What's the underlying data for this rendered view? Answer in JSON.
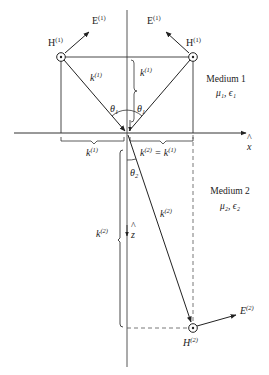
{
  "figure": {
    "type": "wave refraction diagram at planar interface",
    "labels": {
      "H1_left": "H",
      "H1_left_sup": "(1)",
      "H1_left_sub": "+",
      "E1_left": "E",
      "E1_left_sup": "(1)",
      "E1_left_sub": "+",
      "H1_right": "H",
      "H1_right_sup": "(1)",
      "H1_right_sub": "−",
      "E1_right": "E",
      "E1_right_sup": "(1)",
      "E1_right_sub": "−",
      "k1": "k",
      "k1_sup": "(1)",
      "kz1": "k",
      "kz1_sub": "z",
      "kz1_sup": "(1)",
      "theta1_left": "θ",
      "theta1_left_sub": "1",
      "theta1_right": "θ",
      "theta1_right_sub": "1",
      "kx1": "k",
      "kx1_sub": "x",
      "kx1_sup": "(1)",
      "kx_eq": "k",
      "kx_eq_sub": "x",
      "kx_eq_sup": "(2)",
      "kx_eq_mid": " = k",
      "kx_eq_sub2": "x",
      "kx_eq_sup2": "(1)",
      "x_axis": "x",
      "x_hat": "^",
      "theta2": "θ",
      "theta2_sub": "2",
      "k2": "k",
      "k2_sup": "(2)",
      "kz2": "k",
      "kz2_sub": "z",
      "kz2_sup": "(2)",
      "z_axis": "z",
      "z_hat": "^",
      "E2": "E",
      "E2_sub": "+",
      "E2_sup": "(2)",
      "H2": "H",
      "H2_sub": "+",
      "H2_sup": "(2)"
    },
    "media": {
      "medium1": {
        "name": "Medium 1",
        "params": "μ₁, ϵ₁"
      },
      "medium2": {
        "name": "Medium 2",
        "params": "μ₂, ϵ₂"
      }
    }
  }
}
